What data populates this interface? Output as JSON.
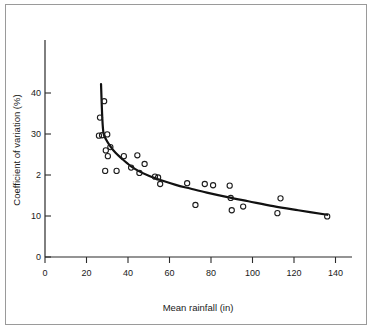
{
  "figure": {
    "border_color": "#9a9a9a",
    "background": "#ffffff"
  },
  "chart_data": {
    "type": "scatter",
    "title": "",
    "xlabel": "Mean rainfall (in)",
    "ylabel": "Coefficient of variation (%)",
    "xlim": [
      0,
      145
    ],
    "ylim": [
      0,
      46
    ],
    "grid": false,
    "legend": null,
    "xticks": [
      0,
      20,
      40,
      60,
      80,
      100,
      120,
      140
    ],
    "xtick_labels": [
      "0",
      "20",
      "40",
      "60",
      "80",
      "100",
      "120",
      "140"
    ],
    "yticks": [
      0,
      10,
      20,
      30,
      40
    ],
    "ytick_labels": [
      "0",
      "10",
      "2",
      "30",
      "40"
    ],
    "marker": "open-circle",
    "marker_color": "#1c1c1c",
    "points": [
      {
        "x": 26.0,
        "y": 29.6
      },
      {
        "x": 26.5,
        "y": 34.0
      },
      {
        "x": 27.5,
        "y": 29.7
      },
      {
        "x": 28.5,
        "y": 38.0
      },
      {
        "x": 29.0,
        "y": 21.0
      },
      {
        "x": 29.3,
        "y": 26.0
      },
      {
        "x": 30.0,
        "y": 29.9
      },
      {
        "x": 30.3,
        "y": 24.6
      },
      {
        "x": 31.5,
        "y": 26.8
      },
      {
        "x": 34.5,
        "y": 21.0
      },
      {
        "x": 38.0,
        "y": 24.6
      },
      {
        "x": 41.5,
        "y": 21.8
      },
      {
        "x": 44.5,
        "y": 24.8
      },
      {
        "x": 45.5,
        "y": 20.5
      },
      {
        "x": 48.0,
        "y": 22.7
      },
      {
        "x": 53.0,
        "y": 19.6
      },
      {
        "x": 54.5,
        "y": 19.4
      },
      {
        "x": 55.5,
        "y": 17.8
      },
      {
        "x": 68.5,
        "y": 18.0
      },
      {
        "x": 72.5,
        "y": 12.7
      },
      {
        "x": 77.0,
        "y": 17.8
      },
      {
        "x": 81.0,
        "y": 17.5
      },
      {
        "x": 89.0,
        "y": 17.4
      },
      {
        "x": 89.5,
        "y": 14.4
      },
      {
        "x": 90.0,
        "y": 11.4
      },
      {
        "x": 95.5,
        "y": 12.3
      },
      {
        "x": 112.0,
        "y": 10.7
      },
      {
        "x": 113.5,
        "y": 14.3
      },
      {
        "x": 136.0,
        "y": 9.9
      }
    ],
    "fit_curve": {
      "description": "fitted decreasing curve",
      "color": "#111111",
      "points": [
        {
          "x": 27.0,
          "y": 42.2
        },
        {
          "x": 27.6,
          "y": 34.0
        },
        {
          "x": 28.2,
          "y": 30.2
        },
        {
          "x": 29.5,
          "y": 28.6
        },
        {
          "x": 31.5,
          "y": 27.0
        },
        {
          "x": 34.0,
          "y": 25.4
        },
        {
          "x": 37.0,
          "y": 24.0
        },
        {
          "x": 41.0,
          "y": 22.3
        },
        {
          "x": 45.0,
          "y": 21.0
        },
        {
          "x": 50.0,
          "y": 19.8
        },
        {
          "x": 56.0,
          "y": 18.7
        },
        {
          "x": 63.0,
          "y": 17.6
        },
        {
          "x": 70.0,
          "y": 16.7
        },
        {
          "x": 78.0,
          "y": 15.7
        },
        {
          "x": 88.0,
          "y": 14.6
        },
        {
          "x": 98.0,
          "y": 13.6
        },
        {
          "x": 110.0,
          "y": 12.4
        },
        {
          "x": 122.0,
          "y": 11.4
        },
        {
          "x": 136.0,
          "y": 10.3
        }
      ]
    }
  }
}
